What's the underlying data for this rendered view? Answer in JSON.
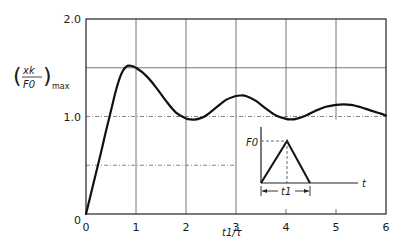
{
  "chart_data": {
    "type": "line",
    "title": "",
    "xlabel": "t1/τ",
    "ylabel": "(xk/F0)max",
    "ylabel_parts": {
      "numerator": "xk",
      "denominator": "F0",
      "subscript": "max"
    },
    "xlim": [
      0,
      6
    ],
    "ylim": [
      0,
      2.0
    ],
    "grid": true,
    "x_ticks": [
      0,
      1,
      2,
      3,
      4,
      5,
      6
    ],
    "x_tick_labels": [
      "0",
      "1",
      "2",
      "3",
      "4",
      "5",
      "6"
    ],
    "y_ticks": [
      0,
      1.0,
      2.0
    ],
    "y_tick_labels": [
      "0",
      "1.0",
      "2.0"
    ],
    "y_gridlines": [
      0.5,
      1.0,
      1.5
    ],
    "series": [
      {
        "name": "Shock spectrum – triangular pulse",
        "x": [
          0,
          0.1,
          0.2,
          0.3,
          0.4,
          0.5,
          0.6,
          0.7,
          0.8,
          0.9,
          1.0,
          1.2,
          1.4,
          1.6,
          1.8,
          2.0,
          2.1,
          2.2,
          2.3,
          2.4,
          2.6,
          2.8,
          3.0,
          3.1,
          3.2,
          3.4,
          3.6,
          3.8,
          4.0,
          4.1,
          4.2,
          4.4,
          4.6,
          4.8,
          5.0,
          5.15,
          5.3,
          5.5,
          5.7,
          5.9,
          6.0
        ],
        "values": [
          0,
          0.21,
          0.42,
          0.63,
          0.85,
          1.06,
          1.27,
          1.43,
          1.51,
          1.52,
          1.5,
          1.42,
          1.3,
          1.16,
          1.04,
          0.98,
          0.97,
          0.97,
          0.985,
          1.01,
          1.09,
          1.17,
          1.21,
          1.215,
          1.21,
          1.16,
          1.08,
          1.01,
          0.975,
          0.97,
          0.975,
          1.01,
          1.06,
          1.1,
          1.12,
          1.125,
          1.12,
          1.095,
          1.06,
          1.03,
          1.01
        ]
      }
    ],
    "inset": {
      "description": "Triangular force pulse",
      "peak_label": "F0",
      "axis_label": "t",
      "duration_label": "t1"
    }
  }
}
